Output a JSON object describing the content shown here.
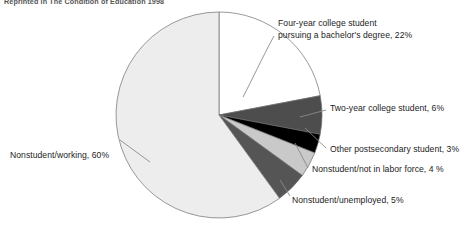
{
  "figure": {
    "source_note": "Reprinted in The Condition of Education 1998"
  },
  "chart_data": {
    "type": "pie",
    "title": "",
    "subtitle": "",
    "xlabel": "",
    "ylabel": "",
    "grid": false,
    "legend_position": "none",
    "units": "percent",
    "start_angle_deg": 0,
    "direction": "clockwise",
    "center": {
      "x": 219,
      "y": 115
    },
    "radius": 103,
    "categories": [
      "Four-year college student pursuing a bachelor's degree",
      "Two-year college student",
      "Other postsecondary student",
      "Nonstudent/not in labor force",
      "Nonstudent/unemployed",
      "Nonstudent/working"
    ],
    "values": [
      22,
      6,
      3,
      4,
      5,
      60
    ],
    "colors": [
      "#ffffff",
      "#4d4d4d",
      "#000000",
      "#c9c9c9",
      "#555555",
      "#ededed"
    ],
    "slices": [
      {
        "key": "four-year",
        "label": "Four-year college student pursuing a bachelor's degree, 22%",
        "label_line1": "Four-year college student",
        "label_line2": "pursuing a bachelor's degree, 22%",
        "value": 22,
        "color": "#ffffff"
      },
      {
        "key": "two-year",
        "label": "Two-year college student, 6%",
        "value": 6,
        "color": "#4d4d4d"
      },
      {
        "key": "other-postsecondary",
        "label": "Other postsecondary student, 3%",
        "value": 3,
        "color": "#000000"
      },
      {
        "key": "nonstudent-not-in-labor-force",
        "label": "Nonstudent/not in labor force, 4 %",
        "value": 4,
        "color": "#c9c9c9"
      },
      {
        "key": "nonstudent-unemployed",
        "label": "Nonstudent/unemployed, 5%",
        "value": 5,
        "color": "#555555"
      },
      {
        "key": "nonstudent-working",
        "label": "Nonstudent/working, 60%",
        "value": 60,
        "color": "#ededed"
      }
    ]
  }
}
